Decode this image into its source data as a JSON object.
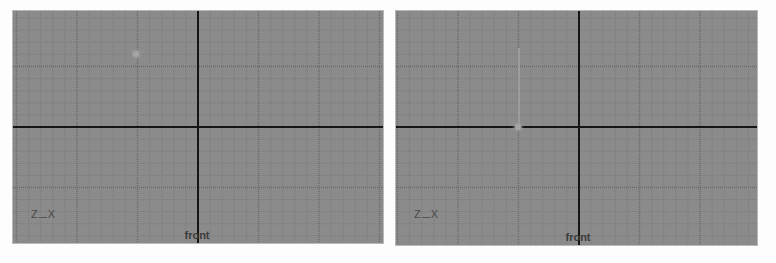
{
  "colors": {
    "background": "#8b8b8b",
    "grid_minor": "#7b7b7b",
    "grid_major": "#6a6a6a",
    "axis": "#151515",
    "label": "#3c3c3c",
    "locator": "#a4a4a4"
  },
  "viewports": [
    {
      "name": "left",
      "view_label": "front",
      "gizmo": {
        "up_axis": "Z",
        "right_axis": "X"
      },
      "locator": {
        "type": "dot"
      }
    },
    {
      "name": "right",
      "view_label": "front",
      "gizmo": {
        "up_axis": "Z",
        "right_axis": "X"
      },
      "locator": {
        "type": "line-with-dot"
      }
    }
  ]
}
